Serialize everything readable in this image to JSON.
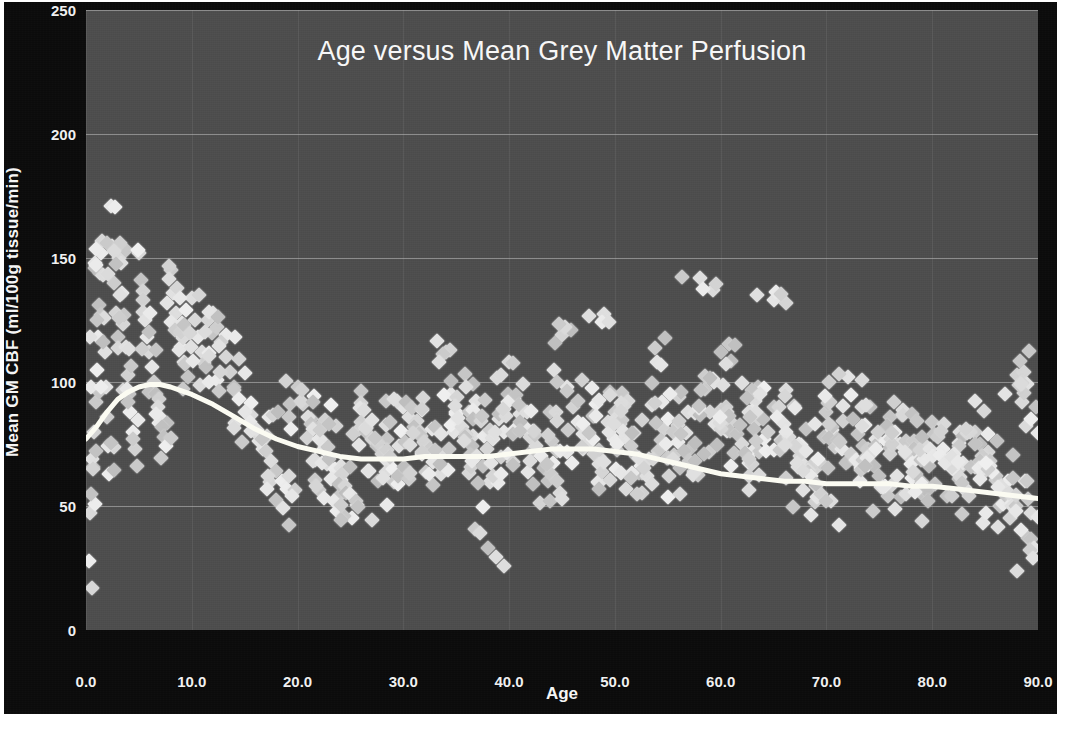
{
  "chart_data": {
    "type": "scatter",
    "title": "Age versus Mean Grey Matter Perfusion",
    "xlabel": "Age",
    "ylabel": "Mean GM CBF (ml/100g tissue/min)",
    "xlim": [
      0,
      90
    ],
    "ylim": [
      0,
      250
    ],
    "xticks": [
      "0.0",
      "10.0",
      "20.0",
      "30.0",
      "40.0",
      "50.0",
      "60.0",
      "70.0",
      "80.0",
      "90.0"
    ],
    "xtick_values": [
      0,
      10,
      20,
      30,
      40,
      50,
      60,
      70,
      80,
      90
    ],
    "yticks": [
      "0",
      "50",
      "100",
      "150",
      "200",
      "250"
    ],
    "ytick_values": [
      0,
      50,
      100,
      150,
      200,
      250
    ],
    "grid": "horizontal",
    "legend": "none",
    "marker": "diamond",
    "marker_color": "#c9c9c9",
    "plot_background": "#4d4d4d",
    "figure_background": "#0b0b0b",
    "text_color": "#f2f2f2",
    "trend_color": "#fbfbf2",
    "series": [
      {
        "name": "Subjects",
        "marker": "diamond",
        "points": [
          [
            0.3,
            28
          ],
          [
            0.4,
            47
          ],
          [
            0.5,
            55
          ],
          [
            0.6,
            69
          ],
          [
            0.8,
            80
          ],
          [
            0.9,
            92
          ],
          [
            1.0,
            105
          ],
          [
            1.1,
            118
          ],
          [
            1.2,
            131
          ],
          [
            1.3,
            144
          ],
          [
            1.4,
            152
          ],
          [
            1.5,
            157
          ],
          [
            1.6,
            143
          ],
          [
            1.7,
            126
          ],
          [
            1.8,
            112
          ],
          [
            1.9,
            98
          ],
          [
            2.0,
            86
          ],
          [
            2.1,
            74
          ],
          [
            2.2,
            63
          ],
          [
            2.4,
            171
          ],
          [
            2.5,
            155
          ],
          [
            2.6,
            140
          ],
          [
            2.8,
            128
          ],
          [
            3.0,
            118
          ],
          [
            3.1,
            150
          ],
          [
            3.2,
            156
          ],
          [
            3.3,
            148
          ],
          [
            3.4,
            136
          ],
          [
            3.6,
            127
          ],
          [
            3.8,
            114
          ],
          [
            4.0,
            103
          ],
          [
            4.1,
            95
          ],
          [
            4.2,
            88
          ],
          [
            4.4,
            80
          ],
          [
            4.6,
            73
          ],
          [
            4.8,
            66
          ],
          [
            5.0,
            152
          ],
          [
            5.2,
            141
          ],
          [
            5.4,
            133
          ],
          [
            5.6,
            125
          ],
          [
            5.8,
            118
          ],
          [
            6.0,
            112
          ],
          [
            6.2,
            106
          ],
          [
            6.4,
            100
          ],
          [
            6.6,
            95
          ],
          [
            6.8,
            90
          ],
          [
            7.0,
            86
          ],
          [
            7.2,
            82
          ],
          [
            7.4,
            78
          ],
          [
            7.6,
            74
          ],
          [
            8.0,
            145
          ],
          [
            8.2,
            136
          ],
          [
            8.5,
            128
          ],
          [
            8.8,
            120
          ],
          [
            9.0,
            114
          ],
          [
            9.3,
            108
          ],
          [
            9.6,
            102
          ],
          [
            10.0,
            134
          ],
          [
            10.3,
            125
          ],
          [
            10.6,
            118
          ],
          [
            11.0,
            112
          ],
          [
            11.3,
            106
          ],
          [
            11.6,
            100
          ],
          [
            12.0,
            128
          ],
          [
            12.4,
            122
          ],
          [
            12.8,
            116
          ],
          [
            13.2,
            110
          ],
          [
            13.6,
            104
          ],
          [
            14.0,
            98
          ],
          [
            14.5,
            93
          ],
          [
            15.0,
            88
          ],
          [
            15.5,
            84
          ],
          [
            16.0,
            80
          ],
          [
            16.5,
            76
          ],
          [
            17.0,
            72
          ],
          [
            17.5,
            68
          ],
          [
            18.0,
            64
          ],
          [
            18.5,
            60
          ],
          [
            19.0,
            57
          ],
          [
            19.5,
            54
          ],
          [
            20.0,
            98
          ],
          [
            20.5,
            91
          ],
          [
            21.0,
            86
          ],
          [
            21.5,
            81
          ],
          [
            22.0,
            77
          ],
          [
            22.5,
            73
          ],
          [
            23.0,
            69
          ],
          [
            23.5,
            65
          ],
          [
            24.0,
            62
          ],
          [
            24.5,
            58
          ],
          [
            25.0,
            55
          ],
          [
            25.5,
            52
          ],
          [
            26.0,
            84
          ],
          [
            26.5,
            80
          ],
          [
            27.0,
            77
          ],
          [
            27.5,
            74
          ],
          [
            28.0,
            71
          ],
          [
            28.5,
            68
          ],
          [
            29.0,
            65
          ],
          [
            29.5,
            62
          ],
          [
            30.0,
            90
          ],
          [
            30.5,
            86
          ],
          [
            31.0,
            82
          ],
          [
            31.5,
            79
          ],
          [
            32.0,
            76
          ],
          [
            32.5,
            73
          ],
          [
            33.0,
            70
          ],
          [
            33.5,
            67
          ],
          [
            34.0,
            112
          ],
          [
            34.5,
            95
          ],
          [
            35.0,
            88
          ],
          [
            35.5,
            82
          ],
          [
            36.0,
            78
          ],
          [
            36.5,
            74
          ],
          [
            37.0,
            70
          ],
          [
            37.5,
            66
          ],
          [
            38.0,
            33
          ],
          [
            38.5,
            62
          ],
          [
            39.0,
            85
          ],
          [
            39.5,
            80
          ],
          [
            40.0,
            108
          ],
          [
            40.5,
            93
          ],
          [
            41.0,
            87
          ],
          [
            41.5,
            82
          ],
          [
            42.0,
            78
          ],
          [
            42.5,
            74
          ],
          [
            43.0,
            70
          ],
          [
            43.5,
            66
          ],
          [
            44.0,
            63
          ],
          [
            44.5,
            60
          ],
          [
            45.0,
            119
          ],
          [
            45.5,
            98
          ],
          [
            46.0,
            90
          ],
          [
            46.5,
            84
          ],
          [
            47.0,
            79
          ],
          [
            47.5,
            75
          ],
          [
            48.0,
            71
          ],
          [
            48.5,
            67
          ],
          [
            49.0,
            125
          ],
          [
            49.5,
            96
          ],
          [
            50.0,
            88
          ],
          [
            50.5,
            83
          ],
          [
            51.0,
            78
          ],
          [
            51.5,
            74
          ],
          [
            52.0,
            70
          ],
          [
            52.5,
            66
          ],
          [
            53.0,
            62
          ],
          [
            53.5,
            59
          ],
          [
            54.0,
            108
          ],
          [
            54.5,
            92
          ],
          [
            55.0,
            85
          ],
          [
            55.5,
            80
          ],
          [
            56.0,
            76
          ],
          [
            56.5,
            72
          ],
          [
            57.0,
            68
          ],
          [
            57.5,
            64
          ],
          [
            58.0,
            142
          ],
          [
            58.5,
            97
          ],
          [
            59.0,
            88
          ],
          [
            59.5,
            83
          ],
          [
            60.0,
            112
          ],
          [
            60.5,
            90
          ],
          [
            61.0,
            84
          ],
          [
            61.5,
            79
          ],
          [
            62.0,
            75
          ],
          [
            62.5,
            71
          ],
          [
            63.0,
            67
          ],
          [
            63.5,
            98
          ],
          [
            64.0,
            85
          ],
          [
            64.5,
            80
          ],
          [
            65.0,
            133
          ],
          [
            65.5,
            90
          ],
          [
            66.0,
            83
          ],
          [
            66.5,
            78
          ],
          [
            67.0,
            74
          ],
          [
            67.5,
            70
          ],
          [
            68.0,
            66
          ],
          [
            68.5,
            62
          ],
          [
            69.0,
            58
          ],
          [
            69.5,
            55
          ],
          [
            70.0,
            88
          ],
          [
            70.5,
            82
          ],
          [
            71.0,
            77
          ],
          [
            71.5,
            73
          ],
          [
            72.0,
            102
          ],
          [
            72.5,
            85
          ],
          [
            73.0,
            79
          ],
          [
            73.5,
            74
          ],
          [
            74.0,
            70
          ],
          [
            74.5,
            66
          ],
          [
            75.0,
            62
          ],
          [
            75.5,
            58
          ],
          [
            76.0,
            86
          ],
          [
            76.5,
            80
          ],
          [
            77.0,
            75
          ],
          [
            77.5,
            71
          ],
          [
            78.0,
            67
          ],
          [
            78.5,
            63
          ],
          [
            79.0,
            59
          ],
          [
            79.5,
            56
          ],
          [
            80.0,
            84
          ],
          [
            80.5,
            78
          ],
          [
            81.0,
            73
          ],
          [
            81.5,
            69
          ],
          [
            82.0,
            65
          ],
          [
            82.5,
            61
          ],
          [
            83.0,
            57
          ],
          [
            83.5,
            54
          ],
          [
            84.0,
            80
          ],
          [
            84.5,
            75
          ],
          [
            85.0,
            70
          ],
          [
            85.5,
            66
          ],
          [
            86.0,
            62
          ],
          [
            86.5,
            58
          ],
          [
            87.0,
            54
          ],
          [
            87.5,
            50
          ],
          [
            88.0,
            103
          ],
          [
            88.5,
            92
          ],
          [
            89.0,
            60
          ],
          [
            89.3,
            47
          ],
          [
            89.6,
            33
          ],
          [
            89.8,
            90
          ]
        ]
      }
    ],
    "trend_line": {
      "name": "LOESS smoother",
      "color": "#fbfbf2",
      "width_px": 5,
      "points": [
        [
          0,
          77
        ],
        [
          1,
          82
        ],
        [
          2,
          88
        ],
        [
          3,
          93
        ],
        [
          4,
          96
        ],
        [
          5,
          98
        ],
        [
          6,
          99
        ],
        [
          7,
          99
        ],
        [
          8,
          98
        ],
        [
          10,
          95
        ],
        [
          12,
          91
        ],
        [
          14,
          86
        ],
        [
          16,
          81
        ],
        [
          18,
          77
        ],
        [
          20,
          74
        ],
        [
          22,
          72
        ],
        [
          24,
          70
        ],
        [
          26,
          69
        ],
        [
          28,
          69
        ],
        [
          30,
          69
        ],
        [
          32,
          70
        ],
        [
          34,
          70
        ],
        [
          36,
          70
        ],
        [
          38,
          70
        ],
        [
          40,
          71
        ],
        [
          42,
          72
        ],
        [
          44,
          73
        ],
        [
          46,
          73
        ],
        [
          48,
          73
        ],
        [
          50,
          72
        ],
        [
          52,
          71
        ],
        [
          54,
          69
        ],
        [
          56,
          67
        ],
        [
          58,
          65
        ],
        [
          60,
          63
        ],
        [
          62,
          62
        ],
        [
          64,
          61
        ],
        [
          66,
          60
        ],
        [
          68,
          60
        ],
        [
          70,
          59
        ],
        [
          72,
          59
        ],
        [
          74,
          59
        ],
        [
          76,
          59
        ],
        [
          78,
          58
        ],
        [
          80,
          58
        ],
        [
          82,
          57
        ],
        [
          84,
          56
        ],
        [
          86,
          55
        ],
        [
          88,
          54
        ],
        [
          90,
          53
        ]
      ]
    }
  }
}
